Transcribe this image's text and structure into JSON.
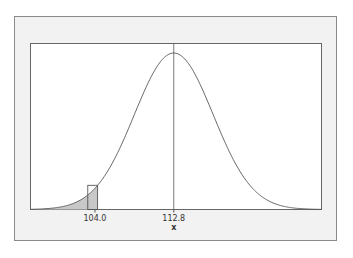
{
  "chart_data": {
    "type": "area",
    "title": "",
    "subtitle": "",
    "xlabel": "x",
    "ylabel": "",
    "distribution": "normal",
    "mean": 112.8,
    "sd_estimate": 4.4,
    "xlim": [
      96.8,
      129.3
    ],
    "x_tick_labels": [
      "104.0",
      "112.8"
    ],
    "x_ticks": [
      104.0,
      112.8
    ],
    "shaded_region": {
      "from": 96.8,
      "to": 104.3,
      "description": "left tail shaded up to 104.0 (with a continuity interval bar 103.2 to 104.3)"
    },
    "highlight_bar": {
      "from": 103.2,
      "to": 104.3
    },
    "reference_line": {
      "x": 112.8,
      "description": "vertical line at mean"
    },
    "grid": false,
    "legend": null
  },
  "colors": {
    "frame_bg": "#f2f2f2",
    "frame_border": "#8a8a8a",
    "plot_bg": "#ffffff",
    "curve": "#555555",
    "shade": "#c8c8c8",
    "line": "#555555"
  }
}
